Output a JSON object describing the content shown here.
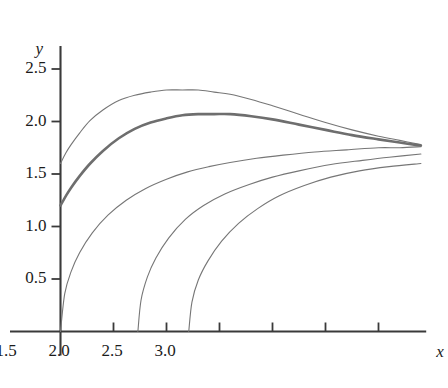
{
  "chart_data": {
    "type": "line",
    "title": "",
    "xlabel": "x",
    "ylabel": "y",
    "xlim": [
      -0.08,
      3.45
    ],
    "ylim": [
      0,
      2.72
    ],
    "grid": false,
    "legend": null,
    "xticks": [
      0,
      0.5,
      1.0,
      1.5,
      2.0,
      2.5,
      3.0
    ],
    "xticklabels": [
      "0",
      "0.5",
      "1.0",
      "1.5",
      "2.0",
      "2.5",
      "3.0"
    ],
    "yticks": [
      0.5,
      1.0,
      1.5,
      2.0,
      2.5
    ],
    "yticklabels": [
      "0.5",
      "1.0",
      "1.5",
      "2.0",
      "2.5"
    ],
    "line_color": "#767676",
    "emphasis_color": "#6e6e6e",
    "axis_color": "#3a3a3a",
    "series": [
      {
        "name": "curve-1",
        "emphasis": false,
        "linewidth": 1.1,
        "x": [
          0.0,
          0.05,
          0.1,
          0.18,
          0.28,
          0.4,
          0.55,
          0.7,
          0.85,
          1.0,
          1.15,
          1.3,
          1.45,
          1.6,
          1.8,
          2.0,
          2.25,
          2.5,
          2.75,
          3.0,
          3.2,
          3.4
        ],
        "y": [
          1.6,
          1.7,
          1.78,
          1.89,
          2.01,
          2.11,
          2.2,
          2.25,
          2.28,
          2.3,
          2.3,
          2.3,
          2.28,
          2.26,
          2.21,
          2.15,
          2.07,
          1.99,
          1.92,
          1.86,
          1.82,
          1.78
        ]
      },
      {
        "name": "curve-2-emphasized",
        "emphasis": true,
        "linewidth": 2.6,
        "x": [
          0.0,
          0.05,
          0.1,
          0.18,
          0.28,
          0.4,
          0.55,
          0.7,
          0.85,
          1.0,
          1.15,
          1.3,
          1.45,
          1.6,
          1.8,
          2.0,
          2.25,
          2.5,
          2.75,
          3.0,
          3.2,
          3.4
        ],
        "y": [
          1.2,
          1.29,
          1.37,
          1.48,
          1.6,
          1.72,
          1.84,
          1.93,
          1.99,
          2.03,
          2.06,
          2.07,
          2.07,
          2.07,
          2.05,
          2.02,
          1.97,
          1.92,
          1.87,
          1.83,
          1.8,
          1.77
        ]
      },
      {
        "name": "curve-3",
        "emphasis": false,
        "linewidth": 1.1,
        "x": [
          0.0,
          0.04,
          0.1,
          0.18,
          0.3,
          0.45,
          0.62,
          0.8,
          1.0,
          1.2,
          1.4,
          1.6,
          1.85,
          2.1,
          2.4,
          2.7,
          3.0,
          3.2,
          3.4
        ],
        "y": [
          0.0,
          0.36,
          0.57,
          0.75,
          0.94,
          1.11,
          1.25,
          1.36,
          1.45,
          1.52,
          1.57,
          1.61,
          1.65,
          1.68,
          1.71,
          1.73,
          1.75,
          1.75,
          1.76
        ]
      },
      {
        "name": "curve-4",
        "emphasis": false,
        "linewidth": 1.1,
        "x": [
          0.73,
          0.76,
          0.82,
          0.9,
          1.02,
          1.18,
          1.35,
          1.55,
          1.78,
          2.0,
          2.25,
          2.55,
          2.85,
          3.1,
          3.4
        ],
        "y": [
          0.0,
          0.3,
          0.52,
          0.7,
          0.89,
          1.07,
          1.2,
          1.31,
          1.4,
          1.47,
          1.53,
          1.59,
          1.63,
          1.66,
          1.69
        ]
      },
      {
        "name": "curve-5",
        "emphasis": false,
        "linewidth": 1.1,
        "x": [
          1.21,
          1.24,
          1.3,
          1.39,
          1.52,
          1.68,
          1.86,
          2.06,
          2.3,
          2.55,
          2.82,
          3.1,
          3.4
        ],
        "y": [
          0.0,
          0.28,
          0.49,
          0.67,
          0.86,
          1.03,
          1.17,
          1.29,
          1.39,
          1.47,
          1.53,
          1.57,
          1.6
        ]
      }
    ]
  }
}
